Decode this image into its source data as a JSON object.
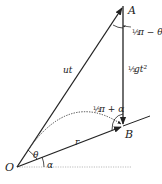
{
  "diagram": {
    "points": {
      "O": {
        "label": "O",
        "x": 17,
        "y": 167
      },
      "A": {
        "label": "A",
        "x": 123,
        "y": 6
      },
      "B": {
        "label": "B",
        "x": 123,
        "y": 126
      }
    },
    "labels": {
      "ut": "ut",
      "r": "r",
      "half_g_t2_coef": "1/2",
      "half_g_t2": "gt²",
      "angle_A_prefix": "½",
      "angle_A": "π − θ",
      "angle_B_prefix": "½",
      "angle_B": "π + α",
      "theta": "θ",
      "alpha": "α"
    },
    "colors": {
      "line": "#222222",
      "dotted": "#555555",
      "baseline": "#bbbbbb"
    }
  }
}
